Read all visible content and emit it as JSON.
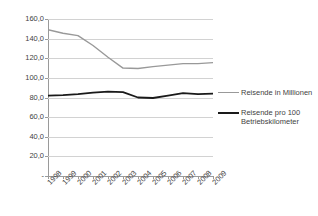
{
  "chart_data": {
    "type": "line",
    "title": "",
    "subtitle": "",
    "xlabel": "",
    "ylabel": "",
    "ylim": [
      0,
      160
    ],
    "ytick_labels": [
      "160,0",
      "140,0",
      "120,0",
      "100,0",
      "80,0",
      "60,0",
      "40,0",
      "20,0",
      "-"
    ],
    "ytick_values": [
      160,
      140,
      120,
      100,
      80,
      60,
      40,
      20,
      0
    ],
    "grid": true,
    "legend_position": "right",
    "categories": [
      "1998",
      "1999",
      "2000",
      "2001",
      "2002",
      "2003",
      "2004",
      "2005",
      "2006",
      "2007",
      "2008",
      "2009"
    ],
    "series": [
      {
        "name": "Reisende in Millionen",
        "color": "#999999",
        "values": [
          149.0,
          145.5,
          143.0,
          133.0,
          121.0,
          110.0,
          109.5,
          111.5,
          113.0,
          114.5,
          114.5,
          115.5
        ]
      },
      {
        "name": "Reisende pro 100 Betriebskilometer",
        "color": "#1a1a1a",
        "values": [
          82.0,
          82.5,
          83.5,
          85.0,
          86.0,
          85.5,
          80.0,
          79.5,
          82.0,
          84.5,
          83.5,
          84.0
        ]
      }
    ]
  },
  "legend": {
    "entries": [
      {
        "label": "Reisende in Millionen"
      },
      {
        "label": "Reisende pro 100 Betriebskilometer"
      }
    ]
  }
}
